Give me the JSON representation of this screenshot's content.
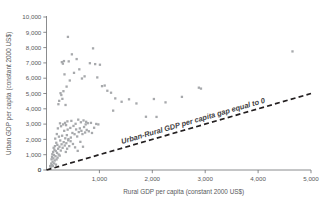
{
  "chart_data": {
    "type": "scatter",
    "title": "",
    "xlabel": "Rural GDP per capita (constant 2000 US$)",
    "ylabel": "Urban GDP per capita (constant 2000 US$)",
    "xlim": [
      0,
      5000
    ],
    "ylim": [
      0,
      10000
    ],
    "xticks": [
      0,
      1000,
      2000,
      3000,
      4000,
      5000
    ],
    "yticks": [
      0,
      1000,
      2000,
      3000,
      4000,
      5000,
      6000,
      7000,
      8000,
      9000,
      10000
    ],
    "xticklabels": [
      "0",
      "1,000",
      "2,000",
      "3,000",
      "4,000",
      "5,000"
    ],
    "yticklabels": [
      "0",
      "1,000",
      "2,000",
      "3,000",
      "4,000",
      "5,000",
      "6,000",
      "7,000",
      "8,000",
      "9,000",
      "10,000"
    ],
    "grid": false,
    "legend": null,
    "marker_color": "#a7a9ac",
    "axis_color": "#6d6e71",
    "text_color": "#58595b",
    "annotations": [
      {
        "text": "Urban-Rural GDP per capita gap equal to 0",
        "kind": "reference-line-label",
        "style": "bold-italic",
        "color": "#414042"
      }
    ],
    "reference_line": {
      "name": "Urban-Rural GDP per capita gap equal to 0",
      "type": "identity",
      "equation": "y = x",
      "from": [
        0,
        0
      ],
      "to": [
        5000,
        5000
      ],
      "dash": true,
      "color": "#231f20"
    },
    "series": [
      {
        "name": "Countries",
        "points": [
          [
            70,
            260
          ],
          [
            80,
            180
          ],
          [
            90,
            420
          ],
          [
            95,
            700
          ],
          [
            100,
            330
          ],
          [
            105,
            860
          ],
          [
            110,
            1030
          ],
          [
            115,
            540
          ],
          [
            120,
            250
          ],
          [
            125,
            1180
          ],
          [
            130,
            760
          ],
          [
            135,
            1450
          ],
          [
            140,
            980
          ],
          [
            145,
            430
          ],
          [
            150,
            1320
          ],
          [
            155,
            620
          ],
          [
            160,
            1560
          ],
          [
            165,
            2050
          ],
          [
            170,
            900
          ],
          [
            175,
            1240
          ],
          [
            180,
            350
          ],
          [
            185,
            1780
          ],
          [
            190,
            690
          ],
          [
            195,
            2350
          ],
          [
            200,
            1120
          ],
          [
            205,
            1640
          ],
          [
            210,
            810
          ],
          [
            215,
            2720
          ],
          [
            220,
            1390
          ],
          [
            225,
            4300
          ],
          [
            230,
            1010
          ],
          [
            235,
            2180
          ],
          [
            240,
            4520
          ],
          [
            245,
            1520
          ],
          [
            250,
            940
          ],
          [
            255,
            3050
          ],
          [
            260,
            1930
          ],
          [
            265,
            5020
          ],
          [
            270,
            1270
          ],
          [
            275,
            2860
          ],
          [
            280,
            4900
          ],
          [
            285,
            1680
          ],
          [
            290,
            7050
          ],
          [
            295,
            2240
          ],
          [
            300,
            4650
          ],
          [
            305,
            1450
          ],
          [
            310,
            6950
          ],
          [
            315,
            2980
          ],
          [
            320,
            5150
          ],
          [
            325,
            1820
          ],
          [
            330,
            7120
          ],
          [
            335,
            2560
          ],
          [
            340,
            6250
          ],
          [
            345,
            1600
          ],
          [
            350,
            3080
          ],
          [
            355,
            2070
          ],
          [
            360,
            4250
          ],
          [
            365,
            1180
          ],
          [
            370,
            2930
          ],
          [
            375,
            1750
          ],
          [
            380,
            5450
          ],
          [
            385,
            2280
          ],
          [
            390,
            1390
          ],
          [
            395,
            3180
          ],
          [
            400,
            2640
          ],
          [
            405,
            8700
          ],
          [
            410,
            1940
          ],
          [
            415,
            2020
          ],
          [
            420,
            7100
          ],
          [
            430,
            1560
          ],
          [
            440,
            5850
          ],
          [
            450,
            2750
          ],
          [
            455,
            1880
          ],
          [
            460,
            2120
          ],
          [
            470,
            3210
          ],
          [
            480,
            7560
          ],
          [
            490,
            2420
          ],
          [
            500,
            1700
          ],
          [
            510,
            2880
          ],
          [
            520,
            6350
          ],
          [
            530,
            2340
          ],
          [
            540,
            1480
          ],
          [
            550,
            3020
          ],
          [
            560,
            2650
          ],
          [
            570,
            7250
          ],
          [
            580,
            2190
          ],
          [
            590,
            1250
          ],
          [
            600,
            3290
          ],
          [
            610,
            2480
          ],
          [
            620,
            6580
          ],
          [
            630,
            2720
          ],
          [
            640,
            1840
          ],
          [
            650,
            3120
          ],
          [
            660,
            2560
          ],
          [
            670,
            5980
          ],
          [
            680,
            2350
          ],
          [
            690,
            1520
          ],
          [
            700,
            3240
          ],
          [
            710,
            2810
          ],
          [
            720,
            6120
          ],
          [
            730,
            2450
          ],
          [
            740,
            2980
          ],
          [
            750,
            3150
          ],
          [
            760,
            2620
          ],
          [
            780,
            3060
          ],
          [
            800,
            2530
          ],
          [
            820,
            6980
          ],
          [
            840,
            3080
          ],
          [
            860,
            2420
          ],
          [
            880,
            7950
          ],
          [
            900,
            2760
          ],
          [
            920,
            6920
          ],
          [
            940,
            3010
          ],
          [
            960,
            6050
          ],
          [
            980,
            2980
          ],
          [
            1010,
            6880
          ],
          [
            1050,
            5480
          ],
          [
            1100,
            5520
          ],
          [
            1150,
            5180
          ],
          [
            1220,
            5050
          ],
          [
            1260,
            3880
          ],
          [
            1300,
            4680
          ],
          [
            1420,
            4460
          ],
          [
            1560,
            4620
          ],
          [
            1700,
            4350
          ],
          [
            1880,
            3480
          ],
          [
            2030,
            4640
          ],
          [
            2080,
            3470
          ],
          [
            2250,
            4420
          ],
          [
            2560,
            4780
          ],
          [
            2880,
            5380
          ],
          [
            2920,
            5320
          ],
          [
            4650,
            7750
          ]
        ]
      }
    ]
  }
}
